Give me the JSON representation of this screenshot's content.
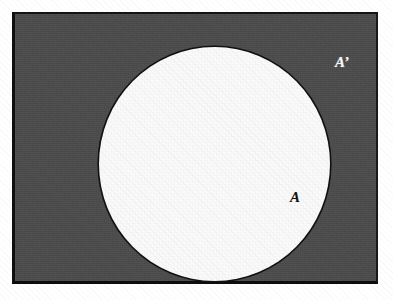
{
  "figure": {
    "kind": "venn-diagram",
    "background_color": "#ffffff"
  },
  "universal_set": {
    "name": "universal-set-rectangle",
    "fill_color": "#4c4c4c",
    "border_color": "#111111",
    "meaning": "shaded region represents the complement of A"
  },
  "set_a": {
    "name": "set-a-circle",
    "fill_color": "#fafafa",
    "outline_color": "#111111"
  },
  "labels": {
    "set_a": "A",
    "set_a_complement": "A’"
  }
}
